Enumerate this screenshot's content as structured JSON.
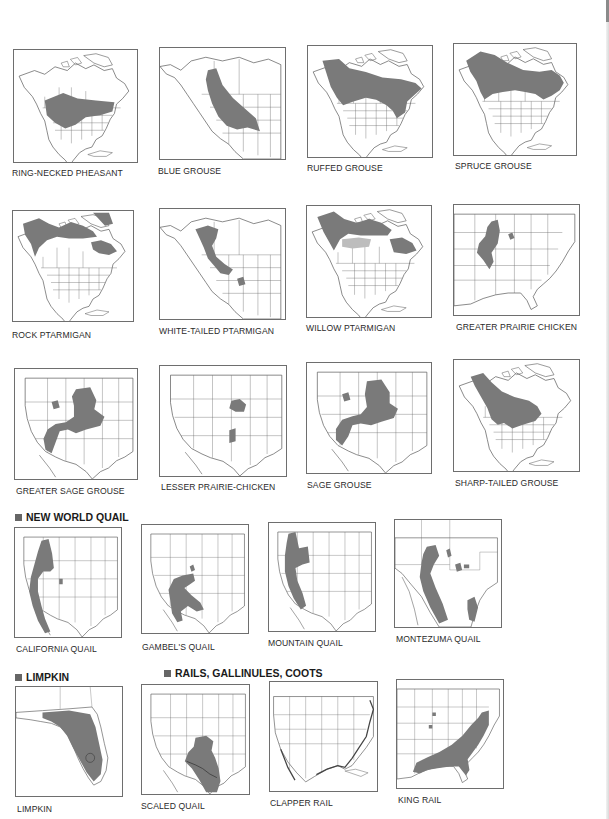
{
  "page": {
    "background": "#ffffff",
    "range_color": "#7a7a7a",
    "outline_color": "#555555"
  },
  "sections": [
    {
      "label": "NEW WORLD QUAIL",
      "icon": "square-bullet-icon"
    },
    {
      "label": "LIMPKIN",
      "icon": "square-bullet-icon"
    },
    {
      "label": "RAILS, GALLINULES, COOTS",
      "icon": "square-bullet-icon"
    }
  ],
  "maps": [
    {
      "caption": "RING-NECKED PHEASANT",
      "region": "north-america"
    },
    {
      "caption": "BLUE GROUSE",
      "region": "western-north-america"
    },
    {
      "caption": "RUFFED GROUSE",
      "region": "north-america"
    },
    {
      "caption": "SPRUCE GROUSE",
      "region": "north-america"
    },
    {
      "caption": "ROCK PTARMIGAN",
      "region": "north-america"
    },
    {
      "caption": "WHITE-TAILED PTARMIGAN",
      "region": "western-north-america"
    },
    {
      "caption": "WILLOW PTARMIGAN",
      "region": "north-america"
    },
    {
      "caption": "GREATER PRAIRIE CHICKEN",
      "region": "eastern-us"
    },
    {
      "caption": "GREATER SAGE GROUSE",
      "region": "western-us"
    },
    {
      "caption": "LESSER PRAIRIE-CHICKEN",
      "region": "south-central-us"
    },
    {
      "caption": "SAGE GROUSE",
      "region": "western-us"
    },
    {
      "caption": "SHARP-TAILED GROUSE",
      "region": "north-america"
    },
    {
      "caption": "CALIFORNIA QUAIL",
      "region": "western-us"
    },
    {
      "caption": "GAMBEL'S QUAIL",
      "region": "western-us"
    },
    {
      "caption": "MOUNTAIN QUAIL",
      "region": "western-us"
    },
    {
      "caption": "MONTEZUMA QUAIL",
      "region": "southwest-us-mexico"
    },
    {
      "caption": "LIMPKIN",
      "region": "florida"
    },
    {
      "caption": "SCALED QUAIL",
      "region": "western-us"
    },
    {
      "caption": "CLAPPER RAIL",
      "region": "united-states"
    },
    {
      "caption": "KING RAIL",
      "region": "eastern-us"
    }
  ]
}
